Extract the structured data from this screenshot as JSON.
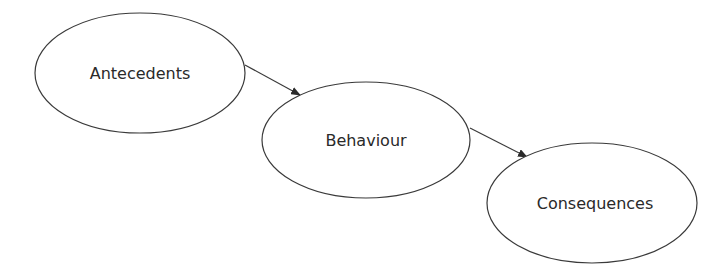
{
  "diagram": {
    "type": "flow",
    "nodes": [
      {
        "id": "antecedents",
        "label": "Antecedents",
        "cx": 140,
        "cy": 73,
        "rx": 105,
        "ry": 60
      },
      {
        "id": "behaviour",
        "label": "Behaviour",
        "cx": 366,
        "cy": 140,
        "rx": 104,
        "ry": 58
      },
      {
        "id": "consequences",
        "label": "Consequences",
        "cx": 592,
        "cy": 203,
        "rx": 105,
        "ry": 60
      }
    ],
    "edges": [
      {
        "from": "antecedents",
        "to": "behaviour"
      },
      {
        "from": "behaviour",
        "to": "consequences"
      }
    ],
    "colors": {
      "stroke": "#3a3a3a",
      "text": "#2a2a2a",
      "background": "#ffffff"
    }
  }
}
